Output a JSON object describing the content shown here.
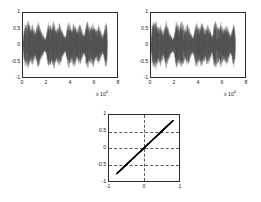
{
  "figure": {
    "background": "#ffffff",
    "axis_color": "#2b2b2b",
    "grid_color": "#5a5a5a",
    "data_color": "#000000"
  },
  "chart_data": [
    {
      "id": "source-signal",
      "type": "line",
      "title": "",
      "xlabel": "",
      "ylabel": "",
      "xlim": [
        0,
        80000
      ],
      "ylim": [
        -1,
        1
      ],
      "xticks": [
        0,
        2,
        4,
        6,
        8
      ],
      "xticklabels": [
        "0",
        "2",
        "4",
        "6",
        "8"
      ],
      "x_exponent_label": "x 10",
      "x_exponent_power": "4",
      "yticks": [
        -1,
        -0.5,
        0,
        0.5,
        1
      ],
      "yticklabels": [
        "-1",
        "-0.5",
        "0",
        "0.5",
        "1"
      ],
      "grid": false,
      "legend": null,
      "description": "Dense audio-like waveform with speech bursts, data spans 0 to about 7.2e4 samples, amplitude envelope peaks near +/-0.85",
      "envelope": [
        [
          0.0,
          0.1
        ],
        [
          0.012,
          0.62
        ],
        [
          0.025,
          0.8
        ],
        [
          0.04,
          0.7
        ],
        [
          0.055,
          0.84
        ],
        [
          0.07,
          0.66
        ],
        [
          0.085,
          0.58
        ],
        [
          0.1,
          0.72
        ],
        [
          0.115,
          0.55
        ],
        [
          0.13,
          0.44
        ],
        [
          0.145,
          0.6
        ],
        [
          0.16,
          0.78
        ],
        [
          0.175,
          0.68
        ],
        [
          0.19,
          0.52
        ],
        [
          0.205,
          0.4
        ],
        [
          0.22,
          0.3
        ],
        [
          0.235,
          0.22
        ],
        [
          0.248,
          0.34
        ],
        [
          0.26,
          0.62
        ],
        [
          0.272,
          0.8
        ],
        [
          0.285,
          0.74
        ],
        [
          0.3,
          0.6
        ],
        [
          0.315,
          0.7
        ],
        [
          0.33,
          0.82
        ],
        [
          0.345,
          0.66
        ],
        [
          0.36,
          0.52
        ],
        [
          0.375,
          0.62
        ],
        [
          0.39,
          0.74
        ],
        [
          0.405,
          0.6
        ],
        [
          0.42,
          0.46
        ],
        [
          0.435,
          0.36
        ],
        [
          0.448,
          0.26
        ],
        [
          0.46,
          0.4
        ],
        [
          0.472,
          0.66
        ],
        [
          0.485,
          0.8
        ],
        [
          0.5,
          0.7
        ],
        [
          0.515,
          0.56
        ],
        [
          0.53,
          0.68
        ],
        [
          0.545,
          0.78
        ],
        [
          0.56,
          0.64
        ],
        [
          0.575,
          0.5
        ],
        [
          0.59,
          0.6
        ],
        [
          0.605,
          0.72
        ],
        [
          0.62,
          0.58
        ],
        [
          0.635,
          0.44
        ],
        [
          0.648,
          0.32
        ],
        [
          0.66,
          0.44
        ],
        [
          0.672,
          0.68
        ],
        [
          0.685,
          0.82
        ],
        [
          0.7,
          0.72
        ],
        [
          0.715,
          0.58
        ],
        [
          0.73,
          0.66
        ],
        [
          0.745,
          0.76
        ],
        [
          0.76,
          0.62
        ],
        [
          0.775,
          0.48
        ],
        [
          0.79,
          0.58
        ],
        [
          0.805,
          0.7
        ],
        [
          0.82,
          0.56
        ],
        [
          0.835,
          0.42
        ],
        [
          0.848,
          0.3
        ],
        [
          0.86,
          0.42
        ],
        [
          0.872,
          0.64
        ],
        [
          0.885,
          0.76
        ],
        [
          0.895,
          0.6
        ],
        [
          0.9,
          0.08
        ]
      ]
    },
    {
      "id": "recovered-signal",
      "type": "line",
      "title": "",
      "xlabel": "",
      "ylabel": "",
      "xlim": [
        0,
        80000
      ],
      "ylim": [
        -1,
        1
      ],
      "xticks": [
        0,
        2,
        4,
        6,
        8
      ],
      "xticklabels": [
        "0",
        "2",
        "4",
        "6",
        "8"
      ],
      "x_exponent_label": "x 10",
      "x_exponent_power": "4",
      "yticks": [
        -1,
        -0.5,
        0,
        0.5,
        1
      ],
      "yticklabels": [
        "-1",
        "-0.5",
        "0",
        "0.5",
        "1"
      ],
      "grid": false,
      "legend": null,
      "description": "Dense audio-like waveform virtually identical to the first plot, data spans 0 to about 7.2e4 samples",
      "envelope": [
        [
          0.0,
          0.12
        ],
        [
          0.012,
          0.64
        ],
        [
          0.025,
          0.82
        ],
        [
          0.04,
          0.72
        ],
        [
          0.055,
          0.82
        ],
        [
          0.07,
          0.64
        ],
        [
          0.085,
          0.56
        ],
        [
          0.1,
          0.74
        ],
        [
          0.115,
          0.57
        ],
        [
          0.13,
          0.42
        ],
        [
          0.145,
          0.62
        ],
        [
          0.16,
          0.8
        ],
        [
          0.175,
          0.66
        ],
        [
          0.19,
          0.5
        ],
        [
          0.205,
          0.38
        ],
        [
          0.22,
          0.28
        ],
        [
          0.235,
          0.24
        ],
        [
          0.248,
          0.36
        ],
        [
          0.26,
          0.64
        ],
        [
          0.272,
          0.82
        ],
        [
          0.285,
          0.72
        ],
        [
          0.3,
          0.58
        ],
        [
          0.315,
          0.72
        ],
        [
          0.33,
          0.8
        ],
        [
          0.345,
          0.64
        ],
        [
          0.36,
          0.54
        ],
        [
          0.375,
          0.64
        ],
        [
          0.39,
          0.72
        ],
        [
          0.405,
          0.58
        ],
        [
          0.42,
          0.44
        ],
        [
          0.435,
          0.34
        ],
        [
          0.448,
          0.28
        ],
        [
          0.46,
          0.42
        ],
        [
          0.472,
          0.68
        ],
        [
          0.485,
          0.78
        ],
        [
          0.5,
          0.72
        ],
        [
          0.515,
          0.54
        ],
        [
          0.53,
          0.7
        ],
        [
          0.545,
          0.76
        ],
        [
          0.56,
          0.62
        ],
        [
          0.575,
          0.52
        ],
        [
          0.59,
          0.62
        ],
        [
          0.605,
          0.7
        ],
        [
          0.62,
          0.56
        ],
        [
          0.635,
          0.46
        ],
        [
          0.648,
          0.3
        ],
        [
          0.66,
          0.46
        ],
        [
          0.672,
          0.7
        ],
        [
          0.685,
          0.8
        ],
        [
          0.7,
          0.7
        ],
        [
          0.715,
          0.6
        ],
        [
          0.73,
          0.64
        ],
        [
          0.745,
          0.78
        ],
        [
          0.76,
          0.6
        ],
        [
          0.775,
          0.5
        ],
        [
          0.79,
          0.6
        ],
        [
          0.805,
          0.68
        ],
        [
          0.82,
          0.58
        ],
        [
          0.835,
          0.4
        ],
        [
          0.848,
          0.32
        ],
        [
          0.86,
          0.44
        ],
        [
          0.872,
          0.62
        ],
        [
          0.885,
          0.78
        ],
        [
          0.895,
          0.58
        ],
        [
          0.9,
          0.1
        ]
      ]
    },
    {
      "id": "correlation-scatter",
      "type": "scatter",
      "title": "",
      "xlabel": "",
      "ylabel": "",
      "xlim": [
        -1,
        1
      ],
      "ylim": [
        -1,
        1
      ],
      "xticks": [
        -1,
        0,
        1
      ],
      "xticklabels": [
        "-1",
        "0",
        "1"
      ],
      "yticks": [
        -1,
        -0.5,
        0,
        0.5,
        1
      ],
      "yticklabels": [
        "-1",
        "-0.5",
        "0",
        "0.5",
        "1"
      ],
      "grid": true,
      "gridlines_h": [
        -0.5,
        0,
        0.5
      ],
      "gridlines_v": [
        0
      ],
      "legend": null,
      "description": "Dense diagonal identity line y = x from about (-0.78,-0.78) to (0.83,0.83), slope 1, indicating near perfect correlation between source and recovered signal",
      "line": {
        "x_start": -0.78,
        "y_start": -0.78,
        "x_end": 0.83,
        "y_end": 0.83,
        "slope": 1.0,
        "intercept": 0.0
      }
    }
  ]
}
